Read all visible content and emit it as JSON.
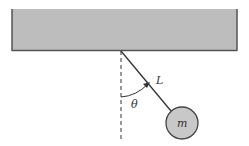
{
  "diagram": {
    "type": "simple-pendulum",
    "labels": {
      "length": "L",
      "angle": "θ",
      "mass": "m"
    },
    "colors": {
      "ceiling_fill": "#bdbdbd",
      "ceiling_edge": "#555555",
      "rod": "#333333",
      "bob_fill": "#c8c8c8",
      "bob_edge": "#444444",
      "dashed_line": "#333333"
    }
  }
}
